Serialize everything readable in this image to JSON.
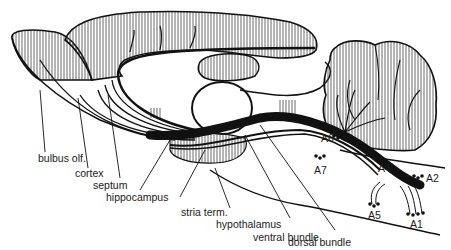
{
  "diagram": {
    "colors": {
      "ink": "#111111",
      "paper": "#ffffff",
      "hatch": "#555555"
    },
    "labels": {
      "bulbus_olf": "bulbus olf.",
      "cortex": "cortex",
      "septum": "septum",
      "hippocampus": "hippocampus",
      "stria_term": "stria term.",
      "hypothalamus": "hypothalamus",
      "ventral_bundle": "ventral bundle",
      "dorsal_bundle": "dorsal bundle",
      "A1": "A1",
      "A2": "A2",
      "A4": "A4",
      "A5": "A5",
      "A6": "A6",
      "A7": "A7"
    }
  }
}
